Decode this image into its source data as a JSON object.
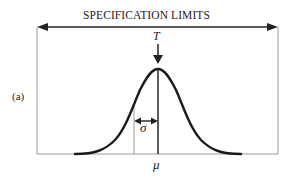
{
  "figure": {
    "title": "SPECIFICATION LIMITS",
    "panel_label": "(a)",
    "target_label": "T",
    "sigma_label": "σ",
    "mean_label": "μ",
    "colors": {
      "curve": "#1a1a1a",
      "frame": "#9a9a9a",
      "arrow": "#222222",
      "text": "#222222"
    },
    "geometry": {
      "spec_lower_x": 37,
      "spec_upper_x": 278,
      "spec_arrow_y": 27,
      "baseline_y": 154,
      "mean_x": 158,
      "sigma_x": 134,
      "peak_y": 69
    }
  }
}
